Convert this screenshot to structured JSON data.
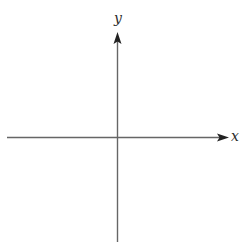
{
  "diagram": {
    "type": "cartesian-axes",
    "x_axis": {
      "label": "x",
      "direction": "right"
    },
    "y_axis": {
      "label": "y",
      "direction": "up"
    },
    "colors": {
      "axis": "#555555",
      "arrow": "#222222",
      "label": "#2b2b2b",
      "background": "#ffffff"
    }
  }
}
